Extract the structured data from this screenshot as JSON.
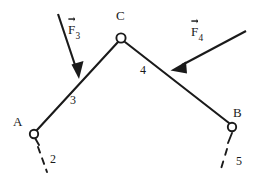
{
  "figure": {
    "type": "statics-truss-free-body-diagram",
    "background_color": "#ffffff",
    "line_color": "#1a1a1a",
    "joints": [
      {
        "id": "A",
        "label": "A",
        "kind": "pin-support",
        "x": 34,
        "y": 134,
        "radius": 4.2
      },
      {
        "id": "C",
        "label": "C",
        "kind": "pin-joint",
        "x": 121,
        "y": 38,
        "radius": 4.6
      },
      {
        "id": "B",
        "label": "B",
        "kind": "pin-support",
        "x": 232,
        "y": 127,
        "radius": 4.2
      }
    ],
    "members": [
      {
        "id": "3",
        "label": "3",
        "from": "A",
        "to": "C",
        "x1": 37,
        "y1": 130,
        "x2": 118,
        "y2": 42
      },
      {
        "id": "4",
        "label": "4",
        "from": "C",
        "to": "B",
        "x1": 125,
        "y1": 42,
        "x2": 229,
        "y2": 123
      }
    ],
    "supports": [
      {
        "id": "2",
        "label": "2",
        "attached_to": "A",
        "style": "dashed",
        "x1": 37,
        "y1": 140,
        "x2": 46,
        "y2": 170
      },
      {
        "id": "5",
        "label": "5",
        "attached_to": "B",
        "style": "dashed",
        "x1": 231,
        "y1": 134,
        "x2": 222,
        "y2": 171
      }
    ],
    "forces": [
      {
        "id": "F3",
        "symbol": "F",
        "subscript": "3",
        "is_vector": true,
        "tail_x": 58,
        "tail_y": 14,
        "tip_x": 79,
        "tip_y": 78,
        "applied_to_member": "3",
        "direction": "down-right"
      },
      {
        "id": "F4",
        "symbol": "F",
        "subscript": "4",
        "is_vector": true,
        "tail_x": 246,
        "tail_y": 31,
        "tip_x": 171,
        "tip_y": 70,
        "applied_to_member": "4",
        "direction": "down-left"
      }
    ],
    "labels": {
      "joint_a": "A",
      "joint_b": "B",
      "joint_c": "C",
      "member_3": "3",
      "member_4": "4",
      "support_2": "2",
      "support_5": "5",
      "force_3_symbol": "F",
      "force_3_sub": "3",
      "force_4_symbol": "F",
      "force_4_sub": "4"
    }
  }
}
